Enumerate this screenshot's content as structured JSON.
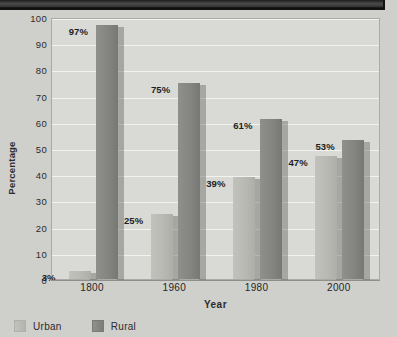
{
  "chart_data": {
    "type": "bar",
    "title": "",
    "xlabel": "Year",
    "ylabel": "Percentage",
    "categories": [
      "1800",
      "1960",
      "1980",
      "2000"
    ],
    "series": [
      {
        "name": "Urban",
        "color": "#b9b9b4",
        "values": [
          3,
          25,
          39,
          47
        ],
        "labels": [
          "3%",
          "25%",
          "39%",
          "47%"
        ]
      },
      {
        "name": "Rural",
        "color": "#848480",
        "values": [
          97,
          75,
          61,
          53
        ],
        "labels": [
          "97%",
          "75%",
          "61%",
          "53%"
        ]
      }
    ],
    "ylim": [
      0,
      100
    ],
    "y_ticks": [
      "0",
      "10",
      "20",
      "30",
      "40",
      "50",
      "60",
      "70",
      "80",
      "90",
      "100"
    ],
    "grid": true,
    "legend_position": "bottom-left"
  },
  "legend": {
    "items": [
      {
        "label": "Urban"
      },
      {
        "label": "Rural"
      }
    ]
  },
  "colors": {
    "background": "#cfcfcb",
    "plot_background": "#d9d9d5",
    "gridline": "#f2f2ee",
    "urban_bar": "#b9b9b4",
    "rural_bar": "#848480",
    "banner": "#3a3a3a",
    "text": "#2b2b2b"
  }
}
